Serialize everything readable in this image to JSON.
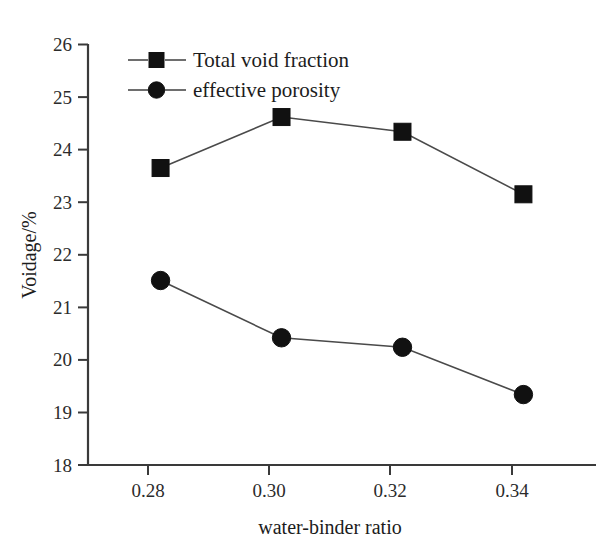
{
  "chart_data": {
    "type": "line",
    "title": "",
    "xlabel": "water-binder ratio",
    "ylabel": "Voidage/%",
    "x": [
      0.28,
      0.3,
      0.32,
      0.34
    ],
    "xtick_labels": [
      "0.28",
      "0.30",
      "0.32",
      "0.34"
    ],
    "ytick_labels": [
      "18",
      "19",
      "20",
      "21",
      "22",
      "23",
      "24",
      "25",
      "26"
    ],
    "ytick_values": [
      18,
      19,
      20,
      21,
      22,
      23,
      24,
      25,
      26
    ],
    "ylim": [
      18,
      26
    ],
    "xlim": [
      0.268,
      0.352
    ],
    "grid": false,
    "legend_position": "top-left",
    "series": [
      {
        "name": "Total void fraction",
        "marker": "square",
        "color": "#111111",
        "values": [
          23.65,
          24.62,
          24.34,
          23.15
        ]
      },
      {
        "name": "effective porosity",
        "marker": "circle",
        "color": "#111111",
        "values": [
          21.51,
          20.42,
          20.24,
          19.34
        ]
      }
    ]
  },
  "legend": {
    "items": [
      {
        "label": "Total void fraction",
        "marker": "square"
      },
      {
        "label": "effective porosity",
        "marker": "circle"
      }
    ]
  },
  "axes": {
    "y_title": "Voidage/%",
    "x_title": "water-binder ratio"
  }
}
